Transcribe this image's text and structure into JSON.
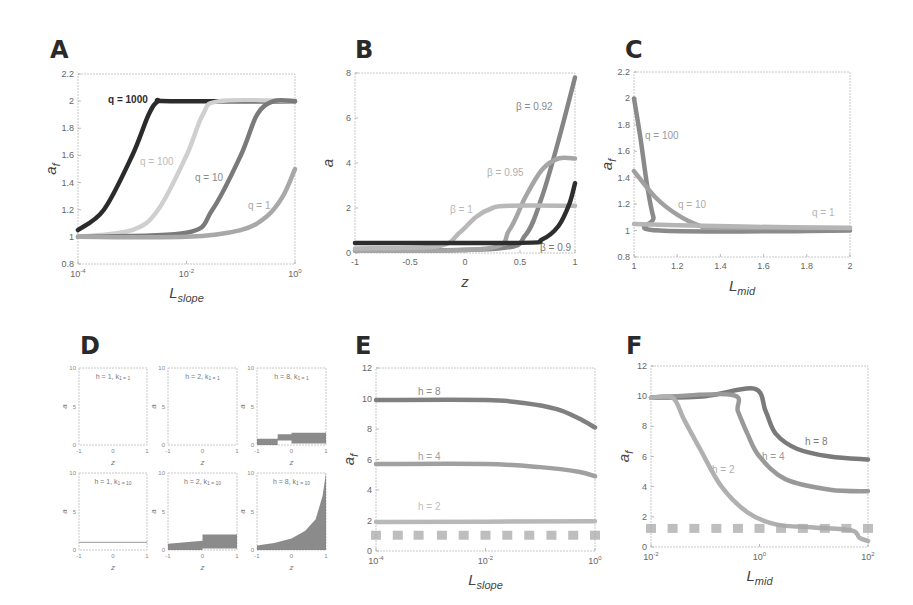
{
  "panels": {
    "A": {
      "letter": "A"
    },
    "B": {
      "letter": "B"
    },
    "C": {
      "letter": "C"
    },
    "D": {
      "letter": "D"
    },
    "E": {
      "letter": "E"
    },
    "F": {
      "letter": "F"
    }
  },
  "chart_data": [
    {
      "panel": "A",
      "type": "line",
      "xlabel": "L_slope",
      "ylabel": "a_f",
      "xscale": "log",
      "xlim": [
        0.0001,
        1
      ],
      "ylim": [
        0.8,
        2.2
      ],
      "xticks": [
        "10^-4",
        "10^-2",
        "10^0"
      ],
      "yticks": [
        0.8,
        1,
        1.2,
        1.4,
        1.6,
        1.8,
        2,
        2.2
      ],
      "series": [
        {
          "name": "q = 1000",
          "color": "#2b2b2b",
          "x": [
            0.0001,
            0.0003,
            0.001,
            0.002,
            0.003,
            0.005,
            1
          ],
          "y": [
            1.05,
            1.2,
            1.6,
            1.9,
            2.0,
            2.0,
            2.0
          ]
        },
        {
          "name": "q = 100",
          "color": "#cfcfcf",
          "x": [
            0.0001,
            0.001,
            0.003,
            0.01,
            0.02,
            0.04,
            1
          ],
          "y": [
            1.0,
            1.05,
            1.2,
            1.6,
            1.9,
            2.0,
            2.0
          ]
        },
        {
          "name": "q = 10",
          "color": "#7a7a7a",
          "x": [
            0.0001,
            0.01,
            0.03,
            0.1,
            0.2,
            0.4,
            1
          ],
          "y": [
            1.0,
            1.03,
            1.2,
            1.6,
            1.9,
            2.0,
            2.0
          ]
        },
        {
          "name": "q = 1",
          "color": "#a8a8a8",
          "x": [
            0.0001,
            0.01,
            0.1,
            0.3,
            0.6,
            1
          ],
          "y": [
            1.0,
            1.0,
            1.05,
            1.15,
            1.3,
            1.5
          ]
        }
      ]
    },
    {
      "panel": "B",
      "type": "line",
      "xlabel": "z",
      "ylabel": "a",
      "xlim": [
        -1,
        1
      ],
      "ylim": [
        0,
        8
      ],
      "xticks": [
        -1,
        -0.5,
        0,
        0.5,
        1
      ],
      "yticks": [
        0,
        2,
        4,
        6,
        8
      ],
      "series": [
        {
          "name": "β = 0.92",
          "color": "#858585",
          "x": [
            -1,
            0.3,
            0.55,
            0.7,
            0.85,
            1
          ],
          "y": [
            0.1,
            0.2,
            0.8,
            2.5,
            5,
            7.8
          ]
        },
        {
          "name": "β = 0.95",
          "color": "#a5a5a5",
          "x": [
            -1,
            0.2,
            0.4,
            0.55,
            0.7,
            0.85,
            1
          ],
          "y": [
            0.1,
            0.2,
            1.0,
            2.5,
            3.7,
            4.2,
            4.2
          ]
        },
        {
          "name": "β = 1",
          "color": "#b8b8b8",
          "x": [
            -1,
            -0.25,
            -0.05,
            0.1,
            0.25,
            0.4,
            1
          ],
          "y": [
            0.2,
            0.3,
            0.9,
            1.6,
            2.0,
            2.1,
            2.1
          ]
        },
        {
          "name": "β = 0.9",
          "color": "#2e2e2e",
          "x": [
            -1,
            0.5,
            0.7,
            0.85,
            0.95,
            1
          ],
          "y": [
            0.45,
            0.45,
            0.6,
            1.2,
            2.2,
            3.1
          ]
        }
      ]
    },
    {
      "panel": "C",
      "type": "line",
      "xlabel": "L_mid",
      "ylabel": "a_f",
      "xlim": [
        1,
        2
      ],
      "ylim": [
        0.8,
        2.2
      ],
      "xticks": [
        1,
        1.2,
        1.4,
        1.6,
        1.8,
        2
      ],
      "yticks": [
        0.8,
        1,
        1.2,
        1.4,
        1.6,
        1.8,
        2,
        2.2
      ],
      "series": [
        {
          "name": "q = 100",
          "color": "#8a8a8a",
          "x": [
            1,
            1.03,
            1.06,
            1.09,
            1.12,
            2
          ],
          "y": [
            2.0,
            1.7,
            1.35,
            1.1,
            1.0,
            1.0
          ]
        },
        {
          "name": "q = 10",
          "color": "#a0a0a0",
          "x": [
            1,
            1.1,
            1.2,
            1.3,
            1.4,
            2
          ],
          "y": [
            1.45,
            1.25,
            1.12,
            1.04,
            1.02,
            1.02
          ]
        },
        {
          "name": "q = 1",
          "color": "#b5b5b5",
          "x": [
            1,
            1.2,
            1.5,
            2
          ],
          "y": [
            1.05,
            1.04,
            1.03,
            1.02
          ]
        }
      ]
    },
    {
      "panel": "D",
      "type": "area",
      "xlabel": "z",
      "ylabel": "a",
      "xlim": [
        -1,
        1
      ],
      "ylim": [
        0,
        10
      ],
      "xticks": [
        -1,
        0,
        1
      ],
      "yticks": [
        0,
        5,
        10
      ],
      "subplots": [
        {
          "title": "h = 1, k_1 = 1",
          "x": [
            -1,
            1
          ],
          "low": [
            0,
            0
          ],
          "high": [
            0,
            0
          ]
        },
        {
          "title": "h = 2, k_1 = 1",
          "x": [
            -1,
            1
          ],
          "low": [
            0,
            0
          ],
          "high": [
            0,
            0
          ]
        },
        {
          "title": "h = 8, k_1 = 1",
          "x": [
            -1,
            -0.4,
            -0.4,
            0,
            0,
            1
          ],
          "low": [
            0,
            0,
            0.6,
            0.6,
            0.2,
            0.2
          ],
          "high": [
            0.8,
            0.8,
            1.4,
            1.4,
            1.6,
            1.6
          ]
        },
        {
          "title": "h = 1, k_1 = 10",
          "x": [
            -1,
            1
          ],
          "low": [
            1,
            1
          ],
          "high": [
            1,
            1
          ]
        },
        {
          "title": "h = 2, k_1 = 10",
          "x": [
            -1,
            0,
            0,
            1
          ],
          "low": [
            0,
            0,
            0.2,
            0.2
          ],
          "high": [
            0.8,
            1.2,
            2,
            2
          ]
        },
        {
          "title": "h = 8, k_1 = 10",
          "x": [
            -1,
            -0.5,
            0,
            0.4,
            0.7,
            0.9,
            1
          ],
          "low": [
            0,
            0,
            0,
            0,
            0,
            0,
            0
          ],
          "high": [
            0.6,
            0.9,
            1.5,
            2.5,
            4,
            7,
            10
          ]
        }
      ]
    },
    {
      "panel": "E",
      "type": "line",
      "xlabel": "L_slope",
      "ylabel": "a_f",
      "xscale": "log",
      "xlim": [
        0.0001,
        1
      ],
      "ylim": [
        0,
        12
      ],
      "xticks": [
        "10^-4",
        "10^-2",
        "10^0"
      ],
      "yticks": [
        0,
        2,
        4,
        6,
        8,
        10,
        12
      ],
      "series": [
        {
          "name": "h = 8",
          "color": "#808080",
          "x": [
            0.0001,
            0.01,
            0.05,
            0.2,
            0.5,
            1
          ],
          "y": [
            9.9,
            9.9,
            9.7,
            9.3,
            8.7,
            8.1
          ]
        },
        {
          "name": "h = 4",
          "color": "#a0a0a0",
          "x": [
            0.0001,
            0.01,
            0.1,
            0.5,
            1
          ],
          "y": [
            5.7,
            5.7,
            5.5,
            5.2,
            4.9
          ]
        },
        {
          "name": "h = 2",
          "color": "#b8b8b8",
          "x": [
            0.0001,
            1
          ],
          "y": [
            1.9,
            1.95
          ]
        },
        {
          "name": "h = 1 (markers)",
          "color": "#a8a8a8",
          "style": "markers",
          "x": [
            0.0001,
            0.00025,
            0.0006,
            0.0016,
            0.004,
            0.01,
            0.025,
            0.063,
            0.16,
            0.4,
            1
          ],
          "y": [
            1.0,
            1.0,
            1.0,
            1.0,
            1.0,
            1.0,
            1.0,
            1.0,
            1.0,
            1.0,
            1.0
          ]
        }
      ]
    },
    {
      "panel": "F",
      "type": "line",
      "xlabel": "L_mid",
      "ylabel": "a_f",
      "xscale": "log",
      "xlim": [
        0.01,
        100
      ],
      "ylim": [
        0,
        12
      ],
      "xticks": [
        "10^-2",
        "10^0",
        "10^2"
      ],
      "yticks": [
        0,
        2,
        4,
        6,
        8,
        10,
        12
      ],
      "series": [
        {
          "name": "h = 8",
          "color": "#7a7a7a",
          "x": [
            0.01,
            0.1,
            0.8,
            1.3,
            2,
            5,
            20,
            100
          ],
          "y": [
            9.9,
            10.0,
            10.5,
            9.0,
            7.5,
            6.5,
            6.0,
            5.8
          ]
        },
        {
          "name": "h = 4",
          "color": "#999999",
          "x": [
            0.01,
            0.3,
            0.4,
            0.6,
            1,
            3,
            20,
            100
          ],
          "y": [
            9.9,
            10.1,
            9.0,
            7.5,
            6.0,
            4.5,
            3.8,
            3.7
          ]
        },
        {
          "name": "h = 2",
          "color": "#b0b0b0",
          "x": [
            0.01,
            0.025,
            0.04,
            0.08,
            0.2,
            0.6,
            2,
            10,
            50,
            70,
            100
          ],
          "y": [
            9.9,
            9.9,
            8.5,
            6.5,
            4.0,
            2.3,
            1.5,
            1.3,
            1.1,
            0.6,
            0.4
          ]
        },
        {
          "name": "h = 1 (markers)",
          "color": "#a8a8a8",
          "style": "markers",
          "x": [
            0.01,
            0.025,
            0.063,
            0.16,
            0.4,
            1,
            2.5,
            6.3,
            16,
            40,
            100
          ],
          "y": [
            1.2,
            1.2,
            1.2,
            1.2,
            1.2,
            1.2,
            1.2,
            1.2,
            1.2,
            1.2,
            1.2
          ]
        }
      ]
    }
  ]
}
